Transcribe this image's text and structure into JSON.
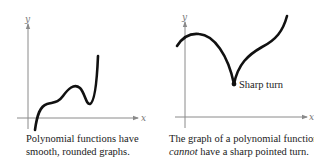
{
  "left_panel": {
    "axis_labels": {
      "x": "x",
      "y": "y"
    },
    "caption_line1": "Polynomial functions have",
    "caption_line2": "smooth, rounded graphs."
  },
  "right_panel": {
    "axis_labels": {
      "x": "x",
      "y": "y"
    },
    "annotation": "Sharp turn",
    "caption_line1": "The graph of a polynomial function",
    "caption_line2_emphasis": "cannot",
    "caption_line2_rest": " have a sharp pointed turn."
  },
  "colors": {
    "curve": "#111111",
    "axis": "#8a8a8a",
    "text": "#222222"
  }
}
